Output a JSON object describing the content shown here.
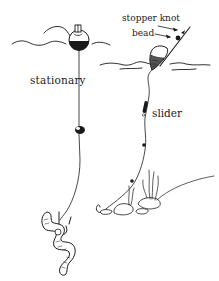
{
  "diagram": {
    "ink_color": "#1a1a1a",
    "background_color": "#ffffff",
    "labels": {
      "stationary": "stationary",
      "slider": "slider",
      "stopper_knot": "stopper knot",
      "bead": "bead"
    },
    "rigs": [
      {
        "name": "stationary",
        "components": [
          "float",
          "line",
          "split-shot sinker",
          "hook",
          "worm bait"
        ]
      },
      {
        "name": "slider",
        "components": [
          "stopper knot",
          "bead",
          "sliding float",
          "line",
          "slider swivel",
          "split shot",
          "hook",
          "rocks",
          "weeds"
        ]
      }
    ]
  }
}
